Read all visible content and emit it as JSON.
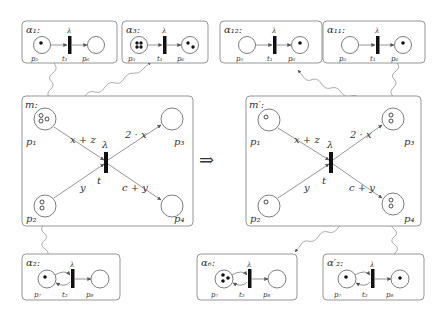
{
  "diagram": {
    "implication_symbol": "⇒",
    "subnets_top": [
      {
        "id": "a1",
        "label": "α₁:",
        "transition": "λ",
        "transition_name": "t₁",
        "place_in": "p₅",
        "place_out": "p₆",
        "tokens_in": 1,
        "tokens_out": 0,
        "loop": false
      },
      {
        "id": "a3",
        "label": "α₃:",
        "transition": "λ",
        "transition_name": "t₁",
        "place_in": "p₅",
        "place_out": "p₆",
        "tokens_in": 4,
        "tokens_out": 2,
        "loop": false
      },
      {
        "id": "a12",
        "label": "α₁₂:",
        "transition": "λ",
        "transition_name": "t₁",
        "place_in": "p₅",
        "place_out": "p₆",
        "tokens_in": 0,
        "tokens_out": 1,
        "loop": false
      },
      {
        "id": "a11",
        "label": "α₁₁:",
        "transition": "λ",
        "transition_name": "t₁",
        "place_in": "p₅",
        "place_out": "p₆",
        "tokens_in": 0,
        "tokens_out": 1,
        "loop": false
      }
    ],
    "subnets_bottom": [
      {
        "id": "a2",
        "label": "α₂:",
        "transition": "λ",
        "transition_name": "t₂",
        "place_in": "p₇",
        "place_out": "p₈",
        "tokens_in": 1,
        "tokens_out": 0,
        "loop": true
      },
      {
        "id": "a6",
        "label": "α₆:",
        "transition": "λ",
        "transition_name": "t₂",
        "place_in": "p₇",
        "place_out": "p₈",
        "tokens_in": 3,
        "tokens_out": 0,
        "loop": true
      },
      {
        "id": "a2p",
        "label": "α′₂:",
        "transition": "λ",
        "transition_name": "t₂",
        "place_in": "p₇",
        "place_out": "p₈",
        "tokens_in": 1,
        "tokens_out": 1,
        "loop": true
      }
    ],
    "main_nets": [
      {
        "id": "m",
        "label": "m:",
        "transition_label": "λ",
        "transition_name": "t",
        "places": [
          "p₁",
          "p₂",
          "p₃",
          "p₄"
        ],
        "tokens": {
          "p1": 3,
          "p2": 2,
          "p3": 0,
          "p4": 0
        },
        "arc_labels": {
          "p1_t": "x + z",
          "p2_t": "y",
          "t_p3": "2 · x",
          "t_p4": "c + y"
        }
      },
      {
        "id": "m_prime",
        "label": "m′:",
        "transition_label": "λ",
        "transition_name": "t",
        "places": [
          "p₁",
          "p₂",
          "p₃",
          "p₄"
        ],
        "tokens": {
          "p1": 1,
          "p2": 1,
          "p3": 2,
          "p4": 2
        },
        "arc_labels": {
          "p1_t": "x + z",
          "p2_t": "y",
          "t_p3": "2 · x",
          "t_p4": "c + y"
        }
      }
    ]
  }
}
